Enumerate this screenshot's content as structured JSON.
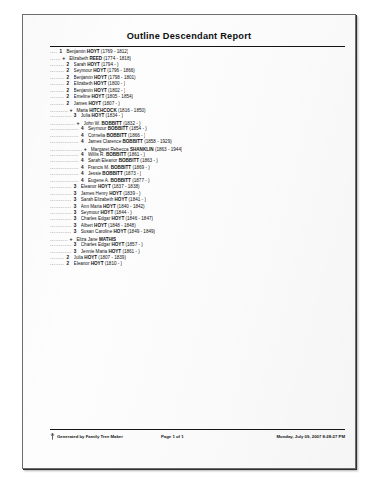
{
  "document": {
    "title": "Outline Descendant Report"
  },
  "outline": {
    "entries": [
      {
        "leader": "....",
        "gen": "1",
        "text": "Benjamin HOYT (1769 - 1812)",
        "spouse": false
      },
      {
        "leader": "......",
        "gen": "+",
        "text": "Elizabeth REED (1774 - 1818)",
        "spouse": true
      },
      {
        "leader": "........",
        "gen": "2",
        "text": "Sarah HOYT (1794 - )",
        "spouse": false
      },
      {
        "leader": "........",
        "gen": "2",
        "text": "Seymour HOYT (1796 - 1866)",
        "spouse": false
      },
      {
        "leader": "........",
        "gen": "2",
        "text": "Benjamin HOYT (1798 - 1801)",
        "spouse": false
      },
      {
        "leader": "........",
        "gen": "2",
        "text": "Elizabeth HOYT (1800 - )",
        "spouse": false
      },
      {
        "leader": "........",
        "gen": "2",
        "text": "Benjamin HOYT (1802 - )",
        "spouse": false
      },
      {
        "leader": "........",
        "gen": "2",
        "text": "Emeline HOYT (1805 - 1854)",
        "spouse": false
      },
      {
        "leader": "........",
        "gen": "2",
        "text": "James HOYT (1807 - )",
        "spouse": false
      },
      {
        "leader": "..........",
        "gen": "+",
        "text": "Maria HITCHCOCK (1816 - 1850)",
        "spouse": true
      },
      {
        "leader": "............",
        "gen": "3",
        "text": "Julia HOYT (1834 - )",
        "spouse": false
      },
      {
        "leader": "..............",
        "gen": "+",
        "text": "John W. BOBBITT (1832 - )",
        "spouse": true
      },
      {
        "leader": "................",
        "gen": "4",
        "text": "Seymour BOBBITT (1854 - )",
        "spouse": false
      },
      {
        "leader": "................",
        "gen": "4",
        "text": "Cornelia BOBBITT (1866 - )",
        "spouse": false
      },
      {
        "leader": "................",
        "gen": "4",
        "text": "James Clarence BOBBITT (1858 - 1929)",
        "spouse": false
      },
      {
        "leader": "..................",
        "gen": "+",
        "text": "Margaret Rebecca SHANKLIN (1863 - 1944)",
        "spouse": true
      },
      {
        "leader": "................",
        "gen": "4",
        "text": "Willis R. BOBBITT (1861 - )",
        "spouse": false
      },
      {
        "leader": "................",
        "gen": "4",
        "text": "Sarah Eleanor BOBBITT (1863 - )",
        "spouse": false
      },
      {
        "leader": "................",
        "gen": "4",
        "text": "Francis M. BOBBITT (1869 - )",
        "spouse": false
      },
      {
        "leader": "................",
        "gen": "4",
        "text": "Jessie BOBBITT (1873 - )",
        "spouse": false
      },
      {
        "leader": "................",
        "gen": "4",
        "text": "Eugene A. BOBBITT (1877 - )",
        "spouse": false
      },
      {
        "leader": "............",
        "gen": "3",
        "text": "Eleanor HOYT (1837 - 1838)",
        "spouse": false
      },
      {
        "leader": "............",
        "gen": "3",
        "text": "James Henry HOYT (1839 - )",
        "spouse": false
      },
      {
        "leader": "............",
        "gen": "3",
        "text": "Sarah Elizabeth HOYT (1841 - )",
        "spouse": false
      },
      {
        "leader": "............",
        "gen": "3",
        "text": "Ann Maria HOYT (1840 - 1842)",
        "spouse": false
      },
      {
        "leader": "............",
        "gen": "3",
        "text": "Seymour HOYT (1844 - )",
        "spouse": false
      },
      {
        "leader": "............",
        "gen": "3",
        "text": "Charles Edgar HOYT (1846 - 1847)",
        "spouse": false
      },
      {
        "leader": "............",
        "gen": "3",
        "text": "Albert HOYT (1848 - 1848)",
        "spouse": false
      },
      {
        "leader": "............",
        "gen": "3",
        "text": "Susan Caroline HOYT (1849 - 1849)",
        "spouse": false
      },
      {
        "leader": "..........",
        "gen": "+",
        "text": "Eliza Jane MATHIS",
        "spouse": true
      },
      {
        "leader": "............",
        "gen": "3",
        "text": "Charles Edgar HOYT (1857 - )",
        "spouse": false
      },
      {
        "leader": "............",
        "gen": "3",
        "text": "Jennie Maria HOYT (1861 - )",
        "spouse": false
      },
      {
        "leader": "........",
        "gen": "2",
        "text": "Julia HOYT (1807 - 1839)",
        "spouse": false
      },
      {
        "leader": "........",
        "gen": "2",
        "text": "Eleanor HOYT (1810 - )",
        "spouse": false
      }
    ]
  },
  "footer": {
    "credit": "Generated by Family Tree Maker",
    "page": "Page 1 of 1",
    "timestamp": "Monday, July 09, 2007 8:28:27 PM"
  }
}
